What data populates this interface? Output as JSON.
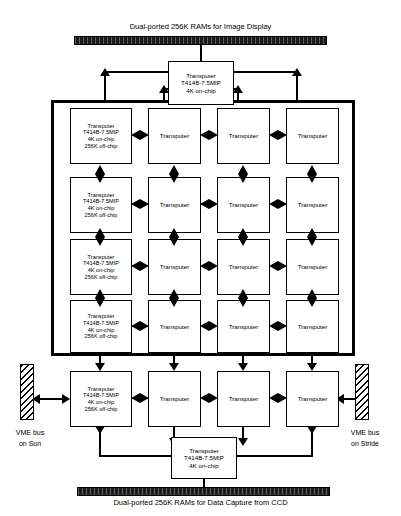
{
  "figure": {
    "top_ram_label": "Dual-ported 256K RAMs for Image Display",
    "bottom_ram_label": "Dual-ported 256K RAMs for Data Capture from CCD",
    "left_bus_label_line1": "VME bus",
    "left_bus_label_line2": "on Sun",
    "right_bus_label_line1": "VME bus",
    "right_bus_label_line2": "on Stride"
  },
  "labels": {
    "transputer": "Transputer",
    "chip": "T414B-7.5MIP",
    "on_chip": "4K on-chip",
    "off_chip": "256K off-chip"
  },
  "nodes": {
    "display_controller": {
      "line1": "Transputer",
      "line2": "T414B-7.5MIP",
      "line3": "4K on-chip"
    },
    "capture_controller": {
      "line1": "Transputer",
      "line2": "T414B-7.5MIP",
      "line3": "4K on-chip"
    },
    "memory_node": {
      "line1": "Transputer",
      "line2": "T414B-7.5MIP",
      "line3": "4K on-chip",
      "line4": "256K off-chip"
    },
    "plain_node": {
      "line1": "Transputer"
    }
  },
  "grid": {
    "rows": 4,
    "columns": 4,
    "extra_row_outside": 1,
    "total_array_rows": 5
  },
  "colors": {
    "ink": "#000000",
    "paper": "#ffffff",
    "ram_fill": "#1a1a1a"
  }
}
